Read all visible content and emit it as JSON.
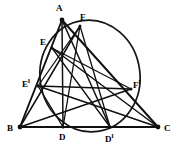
{
  "figure": {
    "type": "geometric-diagram",
    "canvas": {
      "width": 179,
      "height": 148
    },
    "background_color": "#ffffff",
    "ink_color": "#101010",
    "points": [
      {
        "id": "A",
        "label": "A",
        "prime": "",
        "x": 62,
        "y": 20,
        "label_x": 56,
        "label_y": 4,
        "vertex": true
      },
      {
        "id": "B",
        "label": "B",
        "prime": "",
        "x": 20,
        "y": 127,
        "label_x": 7,
        "label_y": 124,
        "vertex": true
      },
      {
        "id": "C",
        "label": "C",
        "prime": "",
        "x": 158,
        "y": 127,
        "label_x": 164,
        "label_y": 124,
        "vertex": true
      },
      {
        "id": "D",
        "label": "D",
        "prime": "",
        "x": 63,
        "y": 127,
        "label_x": 59,
        "label_y": 133,
        "vertex": false
      },
      {
        "id": "Dp",
        "label": "D",
        "prime": "l",
        "x": 110,
        "y": 127,
        "label_x": 105,
        "label_y": 133,
        "vertex": false
      },
      {
        "id": "E",
        "label": "E",
        "prime": "",
        "x": 52,
        "y": 48,
        "label_x": 40,
        "label_y": 38,
        "vertex": false
      },
      {
        "id": "Ep",
        "label": "E",
        "prime": "l",
        "x": 38,
        "y": 86,
        "label_x": 22,
        "label_y": 78,
        "vertex": false
      },
      {
        "id": "F",
        "label": "F",
        "prime": "",
        "x": 80,
        "y": 26,
        "label_x": 80,
        "label_y": 13,
        "vertex": false
      },
      {
        "id": "Fp",
        "label": "F",
        "prime": "l",
        "x": 131,
        "y": 89,
        "label_x": 133,
        "label_y": 79,
        "vertex": false
      }
    ],
    "circle": {
      "label": "six-point-circle",
      "cx": 90,
      "cy": 76,
      "rx": 50,
      "ry": 56,
      "rotation": -8
    },
    "segments": [
      {
        "from": "A",
        "to": "B",
        "kind": "side"
      },
      {
        "from": "A",
        "to": "C",
        "kind": "side"
      },
      {
        "from": "B",
        "to": "C",
        "kind": "side"
      },
      {
        "from": "A",
        "to": "D",
        "kind": "cevian"
      },
      {
        "from": "A",
        "to": "Dp",
        "kind": "cevian"
      },
      {
        "from": "B",
        "to": "F",
        "kind": "cevian"
      },
      {
        "from": "B",
        "to": "Fp",
        "kind": "cevian"
      },
      {
        "from": "C",
        "to": "E",
        "kind": "cevian"
      },
      {
        "from": "C",
        "to": "Ep",
        "kind": "cevian"
      },
      {
        "from": "E",
        "to": "Fp",
        "kind": "chord"
      },
      {
        "from": "Ep",
        "to": "F",
        "kind": "chord"
      },
      {
        "from": "Ep",
        "to": "Fp",
        "kind": "chord"
      },
      {
        "from": "D",
        "to": "F",
        "kind": "chord"
      },
      {
        "from": "Dp",
        "to": "F",
        "kind": "chord"
      },
      {
        "from": "E",
        "to": "Dp",
        "kind": "chord"
      },
      {
        "from": "Ep",
        "to": "D",
        "kind": "chord"
      }
    ]
  }
}
